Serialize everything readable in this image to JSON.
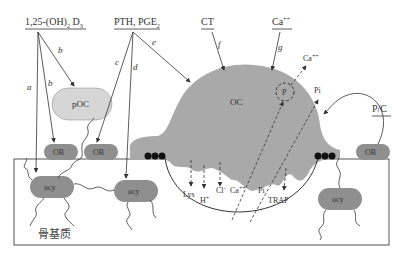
{
  "diagram": {
    "type": "bone-remodeling-schematic",
    "colors": {
      "cell_fill": "#8f8f8f",
      "osteoclast_fill": "#a9a9a9",
      "poc_fill": "#d6d6d6",
      "line": "#333333",
      "background": "#ffffff"
    },
    "regulators": {
      "vitd": {
        "main": "1,25-(OH)",
        "sub1": "2",
        "main2": " D",
        "sub2": "3"
      },
      "pth": {
        "main": "PTH, PGE",
        "sub": "2"
      },
      "ct": {
        "label": "CT"
      },
      "ca": {
        "label": "Ca",
        "sup": "++"
      },
      "pc": {
        "label": "P/C"
      }
    },
    "pathway_letters": [
      "a",
      "b",
      "b",
      "c",
      "d",
      "e",
      "f",
      "g"
    ],
    "cells": {
      "poc": "pOC",
      "oc": "OC",
      "ob_left1": "OB",
      "ob_left2": "OB",
      "ob_right": "OB",
      "ocy1": "ocy",
      "ocy2": "ocy",
      "ocy3": "ocy",
      "p_marker": "P"
    },
    "released": {
      "ca_out": {
        "label": "Ca",
        "sup": "++"
      },
      "pi_out": "Pi"
    },
    "resorption_products": {
      "lys": "Lys",
      "h": {
        "label": "H",
        "sup": "+"
      },
      "cl": {
        "label": "Cl",
        "sup": "-"
      },
      "ca": {
        "label": "Ca",
        "sup": "++"
      },
      "pi": "Pi",
      "trap": "TRAP"
    },
    "matrix_label": "骨基质"
  }
}
